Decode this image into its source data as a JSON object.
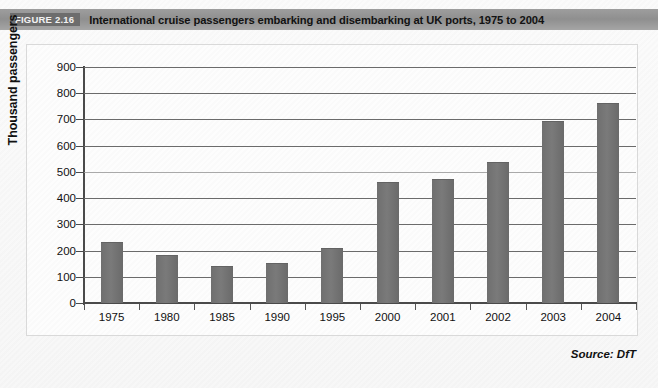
{
  "header": {
    "figure_tag": "FIGURE 2.16",
    "title": "International cruise passengers embarking and disembarking at UK ports, 1975 to 2004"
  },
  "source_note": "Source: DfT",
  "colors": {
    "bar": "#737373",
    "header_band": "#999999",
    "tag_background": "#6d6d6d",
    "gridline": "#6b6b6b",
    "axis": "#4a4a4a"
  },
  "chart_data": {
    "type": "bar",
    "title": "International cruise passengers embarking and disembarking at UK ports, 1975 to 2004",
    "xlabel": "",
    "ylabel": "Thousand passengers",
    "ylim": [
      0,
      900
    ],
    "ytick_step": 100,
    "yticks": [
      900,
      800,
      700,
      600,
      500,
      400,
      300,
      200,
      100,
      0
    ],
    "grid": true,
    "legend": "none",
    "categories": [
      "1975",
      "1980",
      "1985",
      "1990",
      "1995",
      "2000",
      "2001",
      "2002",
      "2003",
      "2004"
    ],
    "values": [
      228,
      180,
      137,
      150,
      205,
      457,
      468,
      533,
      692,
      760
    ],
    "series": [
      {
        "name": "Cruise passengers",
        "values": [
          228,
          180,
          137,
          150,
          205,
          457,
          468,
          533,
          692,
          760
        ]
      }
    ]
  }
}
